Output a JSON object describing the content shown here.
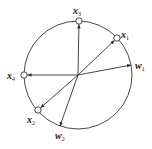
{
  "diagram": {
    "type": "unit-circle-vectors",
    "center": [
      78,
      75
    ],
    "radius": 54,
    "colors": {
      "stroke": "#333333",
      "fill": "#ffffff",
      "text": "#222222"
    },
    "input_vectors": [
      {
        "id": "x1",
        "label": "x",
        "subscript": "1",
        "end": [
          117,
          38
        ],
        "label_pos": [
          121,
          38
        ]
      },
      {
        "id": "x2",
        "label": "x",
        "subscript": "2",
        "end": [
          38,
          110
        ],
        "label_pos": [
          27,
          123
        ]
      },
      {
        "id": "x3",
        "label": "x",
        "subscript": "3",
        "end": [
          79,
          21
        ],
        "label_pos": [
          73,
          14
        ]
      },
      {
        "id": "x4",
        "label": "x",
        "subscript": "4",
        "end": [
          24,
          75
        ],
        "label_pos": [
          7,
          79
        ]
      }
    ],
    "weight_vectors": [
      {
        "id": "w1",
        "label": "w",
        "subscript": "1",
        "end": [
          131,
          65
        ],
        "label_pos": [
          135,
          69
        ]
      },
      {
        "id": "w2",
        "label": "w",
        "subscript": "2",
        "end": [
          60,
          126
        ],
        "label_pos": [
          55,
          139
        ]
      }
    ]
  }
}
